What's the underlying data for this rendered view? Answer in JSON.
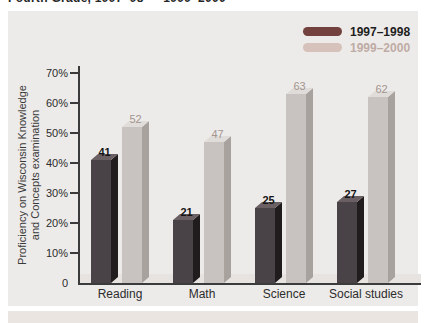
{
  "page": {
    "top_title": "Fourth Grade, 1997–98 — 1999–2000"
  },
  "legend": {
    "items": [
      {
        "label": "1997–1998",
        "color": "#73423e",
        "text_color": "#1e1e1e"
      },
      {
        "label": "1999–2000",
        "color": "#d6c1bb",
        "text_color": "#bfaba5"
      }
    ]
  },
  "chart_data": {
    "type": "bar",
    "title": "Fourth Grade, 1997–98 — 1999–2000",
    "categories": [
      "Reading",
      "Math",
      "Science",
      "Social studies"
    ],
    "series": [
      {
        "name": "1997–1998",
        "values": [
          41,
          21,
          25,
          27
        ]
      },
      {
        "name": "1999–2000",
        "values": [
          52,
          47,
          63,
          62
        ]
      }
    ],
    "ylabel": "Proficiency on Wisconsin Knowledge and Concepts examination",
    "ylabel_lines": [
      "Proficiency on Wisconsin Knowledge",
      "and Concepts examination"
    ],
    "ylim": [
      0,
      70
    ],
    "ytick_step": 10,
    "ytick_labels": [
      "0",
      "10%",
      "20%",
      "30%",
      "40%",
      "50%",
      "60%",
      "70%"
    ],
    "grid": false,
    "legend_position": "top-right",
    "value_labels": true,
    "bar_style": "3d"
  },
  "colors": {
    "panel_bg": "#edebe9",
    "bottom_band_bg": "#ebe5e2",
    "floor_shadow": "#e6e3e0",
    "axis": "#3b3b3b",
    "tick_label": "#2c2c2c",
    "category_label": "#2c2c2c",
    "series": [
      {
        "front": "#494246",
        "side": "#201c1e",
        "top": "#6a5f62",
        "value_label": "#151515",
        "value_weight": "700"
      },
      {
        "front": "#c8c3c0",
        "side": "#a8a29f",
        "top": "#e0dcd9",
        "value_label": "#a2958f",
        "value_weight": "400"
      }
    ]
  }
}
